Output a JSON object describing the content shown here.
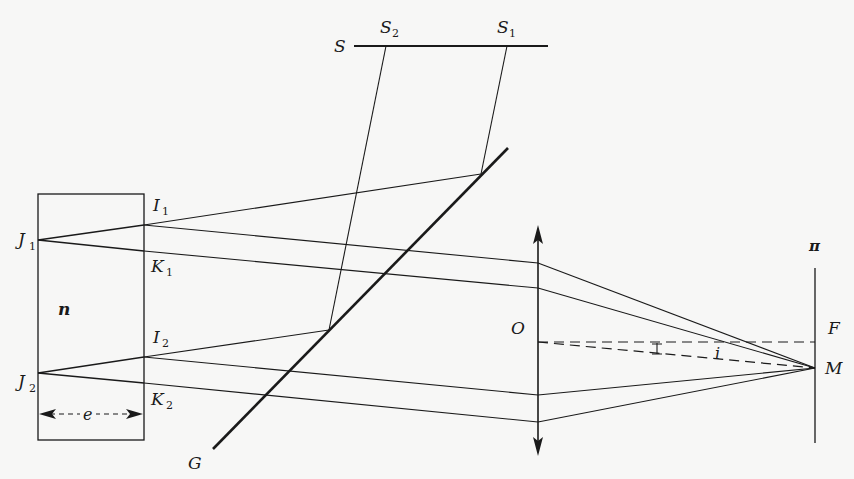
{
  "diagram": {
    "colors": {
      "ink": "#1a1a1a",
      "background": "#f7f7f6"
    },
    "labels": {
      "source": "S",
      "source_2": "S",
      "source_2_sub": "2",
      "source_1": "S",
      "source_1_sub": "1",
      "separator": "G",
      "plate_index": "n",
      "plate_thickness": "e",
      "J1": "J",
      "J1_sub": "1",
      "J2": "J",
      "J2_sub": "2",
      "I1": "I",
      "I1_sub": "1",
      "I2": "I",
      "I2_sub": "2",
      "K1": "K",
      "K1_sub": "1",
      "K2": "K",
      "K2_sub": "2",
      "lens": "O",
      "screen": "π",
      "focus": "F",
      "image_point": "M",
      "angle": "i"
    },
    "geometry": {
      "source_line": {
        "x1": 354,
        "x2": 548,
        "y": 46
      },
      "plate": {
        "x": 38,
        "y": 194,
        "width": 106,
        "height": 246
      },
      "separator_G": {
        "x1": 213,
        "y1": 449,
        "x2": 508,
        "y2": 148
      },
      "lens_x": 538,
      "lens_top": 225,
      "lens_bottom": 455,
      "screen_x": 815,
      "screen_top": 268,
      "screen_bottom": 443,
      "F": [
        815,
        342
      ],
      "M": [
        815,
        368
      ]
    }
  }
}
